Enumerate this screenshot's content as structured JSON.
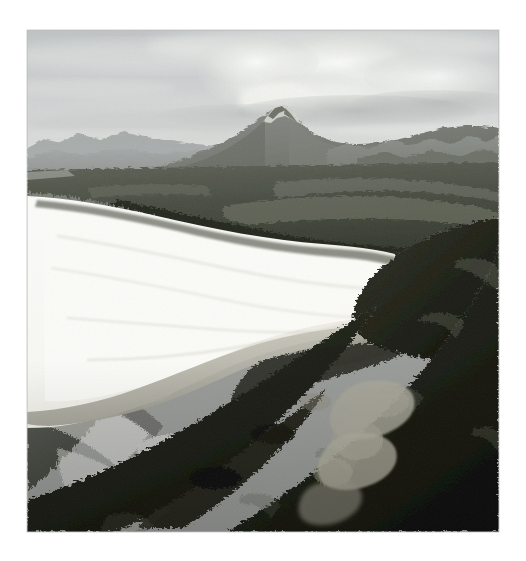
{
  "page": {
    "background_color": "#ffffff",
    "width": 526,
    "height": 561
  },
  "photograph": {
    "title": "Aerial view of a crescent sand beach backed by coastal heath with a conical peak inland",
    "medium": "black-and-white photograph",
    "orientation": "landscape-within-portrait-page",
    "frame": {
      "left": 27,
      "top": 30,
      "width": 472,
      "height": 502,
      "border_color": "#cfcfcf"
    },
    "palette": {
      "sky_high": "#c2c5c6",
      "sky_low": "#dcdedc",
      "cloud_bright": "#f2f2ee",
      "cloud_shadow": "#b4b7b6",
      "distant_ridge": "#8e918e",
      "mountain_face": "#7c7f7c",
      "mid_scrub": "#565a53",
      "dark_scrub": "#20221c",
      "deep_shadow": "#101109",
      "sand_bright": "#f8f8f5",
      "sand_mid": "#e2e1d9",
      "wet_sand": "#b9b8ae",
      "surf_white": "#f0f0ec",
      "water_dark": "#4a4d48",
      "lagoon": "#a8a79c"
    },
    "elements": [
      {
        "name": "sky",
        "description": "pale overcast sky occupying the top fifth of the frame"
      },
      {
        "name": "cumulus-cloud-bank",
        "description": "bright cloud mass billowing above and right of the summit"
      },
      {
        "name": "mountain-peak",
        "description": "conical twin-notched summit near the horizon centre",
        "apex_x": 250,
        "apex_y": 88
      },
      {
        "name": "distant-ridges",
        "description": "layered blue-grey ranges receding left and right of the peak"
      },
      {
        "name": "coastal-plain",
        "description": "dark band of heath and buttongrass flats between the ranges and the dunes"
      },
      {
        "name": "sand-beach",
        "description": "long white crescent of sand sweeping from the left edge to a hooked spit at right"
      },
      {
        "name": "lagoon-outlet",
        "description": "shallow tannin-stained lagoon and creek mouth behind the dunes at lower right"
      },
      {
        "name": "surf-lines",
        "description": "parallel breaking waves and foam across the lower-left ocean"
      },
      {
        "name": "dark-headland-scrub",
        "description": "near-black coastal scrub filling the bottom and right of the frame"
      },
      {
        "name": "rocky-shore",
        "description": "rock platform and boulders between the surf and the scrub at bottom centre"
      }
    ]
  }
}
